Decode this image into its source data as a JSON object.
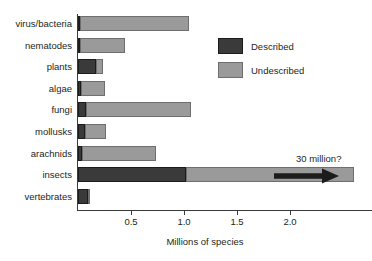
{
  "chart_data": {
    "type": "bar",
    "orientation": "horizontal",
    "stacked": true,
    "title": "",
    "xlabel": "Millions of species",
    "ylabel": "",
    "xlim": [
      0,
      2.77
    ],
    "xticks": [
      0.5,
      1.0,
      1.5,
      2.0
    ],
    "xtick_labels": [
      "0.5",
      "1.0",
      "1.5",
      "2.0"
    ],
    "grid": false,
    "legend_position": "upper right",
    "categories": [
      "virus/bacteria",
      "nematodes",
      "plants",
      "algae",
      "fungi",
      "mollusks",
      "arachnids",
      "insects",
      "vertebrates"
    ],
    "series": [
      {
        "name": "Described",
        "color": "#3a3a3a",
        "values": [
          0.005,
          0.015,
          0.17,
          0.025,
          0.08,
          0.07,
          0.04,
          1.02,
          0.09
        ]
      },
      {
        "name": "Undescribed",
        "color": "#9a9a9a",
        "values": [
          1.03,
          0.42,
          0.07,
          0.23,
          0.99,
          0.19,
          0.7,
          1.58,
          0.015
        ]
      }
    ],
    "annotations": [
      {
        "text": "30 million?",
        "target_category": "insects",
        "marker": "right-arrow"
      }
    ]
  },
  "legend": {
    "items": [
      {
        "label": "Described",
        "swatch": "described"
      },
      {
        "label": "Undescribed",
        "swatch": "undescribed"
      }
    ]
  },
  "axis": {
    "x_title": "Millions of species"
  }
}
